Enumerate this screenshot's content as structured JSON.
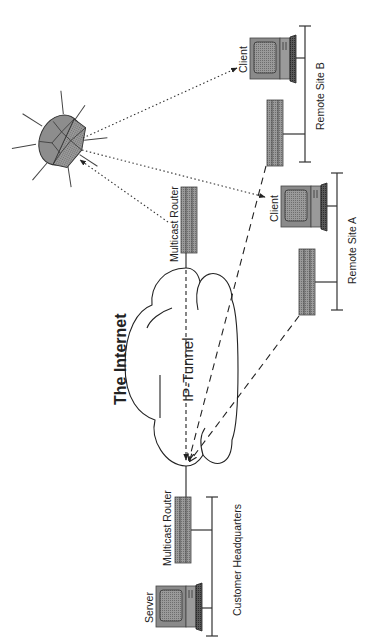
{
  "diagram": {
    "title": "The Internet",
    "tunnel_label": "IP-Tunnel",
    "colors": {
      "background": "#ffffff",
      "device_fill": "#8e8e8e",
      "device_dark": "#555555",
      "line": "#222222"
    },
    "sites": {
      "headquarters": {
        "label": "Customer Headquarters",
        "server_label": "Server",
        "router_label": "Multicast Router"
      },
      "remote_a": {
        "label": "Remote Site A",
        "client_label": "Client"
      },
      "remote_b": {
        "label": "Remote Site B",
        "client_label": "Client"
      }
    },
    "internet_router_label": "Multicast Router",
    "satellite": {
      "icon": "satellite-icon"
    },
    "connections": [
      {
        "from": "hq-router",
        "to": "internet-cloud",
        "style": "solid"
      },
      {
        "from": "internet-router",
        "to": "hq-router",
        "style": "dashed-arrow",
        "label": "IP-Tunnel"
      },
      {
        "from": "remote-a-router",
        "to": "hq-router",
        "style": "dashed-arrow"
      },
      {
        "from": "remote-b-router",
        "to": "hq-router",
        "style": "dashed-arrow"
      },
      {
        "from": "satellite",
        "to": "remote-b-client",
        "style": "dotted-arrow"
      },
      {
        "from": "satellite",
        "to": "remote-a-client",
        "style": "dotted-arrow"
      },
      {
        "from": "internet-router",
        "to": "satellite",
        "style": "dotted-arrow"
      }
    ]
  }
}
